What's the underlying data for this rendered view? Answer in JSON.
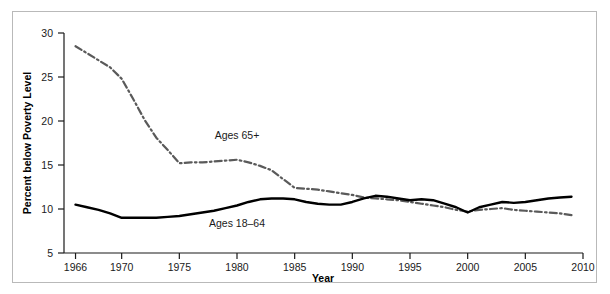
{
  "figure": {
    "background_color": "#ffffff",
    "border_color": "#b9b9b9"
  },
  "chart_data": {
    "type": "line",
    "title": "",
    "subtitle": "",
    "xlabel": "Year",
    "ylabel": "Percent below Poverty Level",
    "xlim": [
      1965,
      2010
    ],
    "ylim": [
      5,
      30
    ],
    "xticks": [
      1966,
      1970,
      1975,
      1980,
      1985,
      1990,
      1995,
      2000,
      2005,
      2010
    ],
    "xtick_labels": [
      "1966",
      "1970",
      "1975",
      "1980",
      "1985",
      "1990",
      "1995",
      "2000",
      "2005",
      "2010"
    ],
    "yticks": [
      5,
      10,
      15,
      20,
      25,
      30
    ],
    "ytick_labels": [
      "5",
      "10",
      "15",
      "20",
      "25",
      "30"
    ],
    "grid": false,
    "legend": "inline-annotations",
    "series": [
      {
        "name": "Ages 65+",
        "label": "Ages 65+",
        "color": "#5a5a5a",
        "linestyle": "dashdot",
        "linewidth": 2.2,
        "annotation": {
          "text": "Ages 65+",
          "x": 1980,
          "y": 17.9
        },
        "x": [
          1966,
          1967,
          1968,
          1969,
          1970,
          1971,
          1972,
          1973,
          1974,
          1975,
          1976,
          1977,
          1978,
          1979,
          1980,
          1981,
          1982,
          1983,
          1984,
          1985,
          1986,
          1987,
          1988,
          1989,
          1990,
          1991,
          1992,
          1993,
          1994,
          1995,
          1996,
          1997,
          1998,
          1999,
          2000,
          2001,
          2002,
          2003,
          2004,
          2005,
          2006,
          2007,
          2008,
          2009
        ],
        "values": [
          28.5,
          27.7,
          26.9,
          26.1,
          24.8,
          22.5,
          20.1,
          18.1,
          16.7,
          15.2,
          15.3,
          15.3,
          15.4,
          15.5,
          15.6,
          15.3,
          14.9,
          14.4,
          13.4,
          12.4,
          12.3,
          12.2,
          12.0,
          11.8,
          11.6,
          11.3,
          11.2,
          11.1,
          11.0,
          10.8,
          10.6,
          10.4,
          10.2,
          9.9,
          9.7,
          9.9,
          10.0,
          10.1,
          9.9,
          9.8,
          9.7,
          9.6,
          9.5,
          9.3
        ]
      },
      {
        "name": "Ages 18-64",
        "label": "Ages 18–64",
        "color": "#000000",
        "linestyle": "solid",
        "linewidth": 2.4,
        "annotation": {
          "text": "Ages 18–64",
          "x": 1980,
          "y": 7.9
        },
        "x": [
          1966,
          1967,
          1968,
          1969,
          1970,
          1971,
          1972,
          1973,
          1974,
          1975,
          1976,
          1977,
          1978,
          1979,
          1980,
          1981,
          1982,
          1983,
          1984,
          1985,
          1986,
          1987,
          1988,
          1989,
          1990,
          1991,
          1992,
          1993,
          1994,
          1995,
          1996,
          1997,
          1998,
          1999,
          2000,
          2001,
          2002,
          2003,
          2004,
          2005,
          2006,
          2007,
          2008,
          2009
        ],
        "values": [
          10.5,
          10.2,
          9.9,
          9.5,
          9.0,
          9.0,
          9.0,
          9.0,
          9.1,
          9.2,
          9.4,
          9.6,
          9.8,
          10.1,
          10.4,
          10.8,
          11.1,
          11.2,
          11.2,
          11.1,
          10.8,
          10.6,
          10.5,
          10.5,
          10.8,
          11.2,
          11.5,
          11.4,
          11.2,
          11.0,
          11.1,
          11.0,
          10.6,
          10.2,
          9.6,
          10.2,
          10.5,
          10.8,
          10.7,
          10.8,
          11.0,
          11.2,
          11.3,
          11.4
        ]
      }
    ]
  }
}
